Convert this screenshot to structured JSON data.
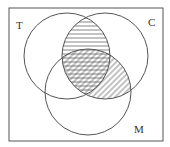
{
  "diagram": {
    "type": "venn",
    "sets": [
      {
        "label": "T",
        "cx": 67,
        "cy": 56,
        "r": 43
      },
      {
        "label": "C",
        "cx": 105,
        "cy": 56,
        "r": 43
      },
      {
        "label": "M",
        "cx": 88,
        "cy": 92,
        "r": 43
      }
    ],
    "shaded_regions": [
      {
        "region": "T ∩ C",
        "pattern": "horizontal-lines"
      },
      {
        "region": "C ∩ M",
        "pattern": "diagonal-lines"
      }
    ],
    "labels": {
      "t": "T",
      "c": "C",
      "m": "M"
    },
    "colors": {
      "stroke": "#555555",
      "hatch": "#666666",
      "background": "#ffffff"
    }
  }
}
